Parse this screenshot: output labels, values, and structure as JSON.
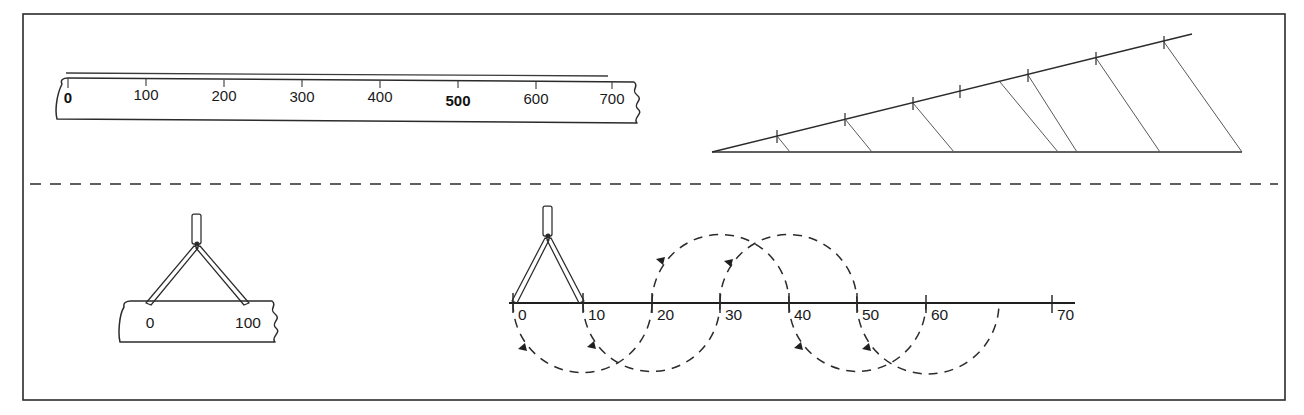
{
  "figure": {
    "width": 1304,
    "height": 415,
    "background_color": "#ffffff",
    "ink_color": "#1f1f1f",
    "border_color": "#2b2b2b"
  },
  "top_ruler": {
    "name": "engineers-scale-700",
    "labels": [
      "0",
      "100",
      "200",
      "300",
      "400",
      "500",
      "600",
      "700"
    ],
    "values": [
      0,
      100,
      200,
      300,
      400,
      500,
      600,
      700
    ],
    "bold_label": "500",
    "has_break_symbol": true,
    "break_side": "right",
    "x_start_px": 62,
    "x_end_px": 612,
    "baseline_y_px": 84
  },
  "wedge": {
    "name": "tapered-scale-wedge",
    "tick_count": 7,
    "apex_x_px": 712,
    "apex_y_px": 152,
    "base_end_x_px": 1242,
    "hypotenuse_end_x_px": 1192,
    "hypotenuse_end_y_px": 34,
    "rib_count": 7
  },
  "divider_rule": {
    "name": "dashed-separator",
    "y_px": 184,
    "dash_pattern": "11 9"
  },
  "small_scale": {
    "name": "scale-0-100",
    "labels": [
      "0",
      "100"
    ],
    "values": [
      0,
      100
    ],
    "has_break_symbol": true,
    "break_side": "right",
    "x_start_px": 124,
    "x_end_px": 263,
    "baseline_y_px": 302
  },
  "compass_small": {
    "name": "dividers-set-to-100",
    "span_label_left": "0",
    "span_label_right": "100",
    "left_point_x_px": 148,
    "right_point_x_px": 247,
    "pivot_x_px": 197,
    "pivot_y_px": 243,
    "point_y_px": 306
  },
  "main_axis": {
    "name": "stepping-off-axis",
    "labels": [
      "0",
      "10",
      "20",
      "30",
      "40",
      "50",
      "60",
      "70"
    ],
    "values": [
      0,
      10,
      20,
      30,
      40,
      50,
      60,
      70
    ],
    "tick_x_px": [
      513,
      583,
      652,
      720,
      789,
      857,
      926,
      1052
    ],
    "line_start_x_px": 509,
    "line_end_x_px": 1075,
    "baseline_y_px": 303,
    "unit_step": 10
  },
  "compass_main": {
    "name": "dividers-set-to-10",
    "left_point_value": 0,
    "right_point_value": 10,
    "pivot_x_px": 548,
    "pivot_y_px": 235,
    "point_y_px": 303
  },
  "step_arcs": {
    "name": "walking-divider-arcs",
    "description": "Semicircular dashed arcs alternating below and above the axis, each spanning two divisions",
    "radius_units": 10,
    "arcs": [
      {
        "from": 0,
        "to": 20,
        "side": "below",
        "arrow_at": "left"
      },
      {
        "from": 10,
        "to": 30,
        "side": "below",
        "arrow_at": "left"
      },
      {
        "from": 20,
        "to": 40,
        "side": "above",
        "arrow_at": "left"
      },
      {
        "from": 30,
        "to": 50,
        "side": "above",
        "arrow_at": "left"
      },
      {
        "from": 40,
        "to": 60,
        "side": "below",
        "arrow_at": "left"
      },
      {
        "from": 50,
        "to": 70,
        "side": "below",
        "arrow_at": "left"
      }
    ]
  }
}
